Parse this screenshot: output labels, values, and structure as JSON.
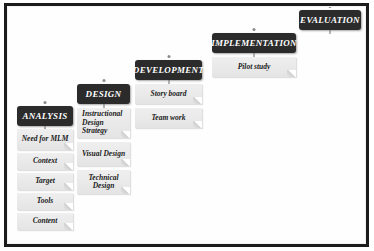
{
  "diagram": {
    "background_color": "#ffffff",
    "frame_color": "#1c1c1c",
    "header_color": "#2b2b2b",
    "item_color": "#ebebeb",
    "stages": [
      {
        "id": "analysis",
        "header": "ANALYSIS",
        "items": [
          "Need for MLM",
          "Context",
          "Target",
          "Tools",
          "Content"
        ]
      },
      {
        "id": "design",
        "header": "DESIGN",
        "items": [
          "Instructional Design Strategy",
          "Visual Design",
          "Technical Design"
        ]
      },
      {
        "id": "development",
        "header": "DEVELOPMENT",
        "items": [
          "Story board",
          "Team work"
        ]
      },
      {
        "id": "implementation",
        "header": "IMPLEMENTATION",
        "items": [
          "Pilot study"
        ]
      },
      {
        "id": "evaluation",
        "header": "EVALUATION",
        "items": []
      }
    ]
  }
}
